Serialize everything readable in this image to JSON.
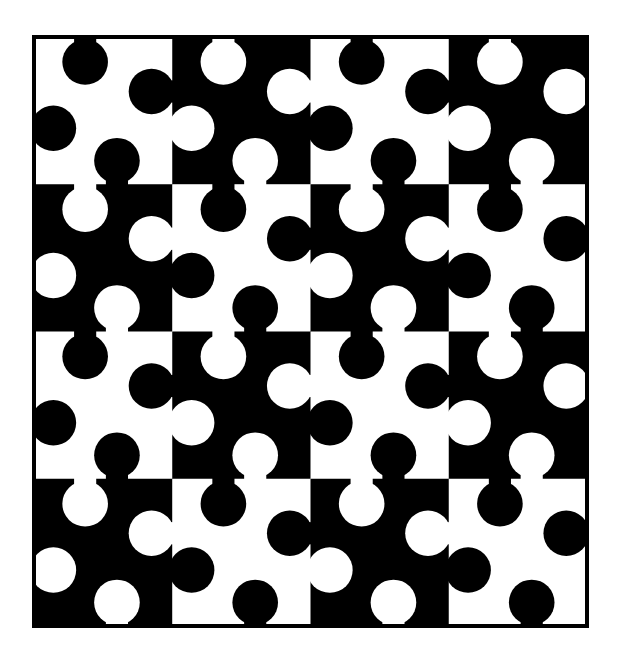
{
  "figure": {
    "title": "",
    "background": "#ffffff",
    "ink": "#000000",
    "frame": {
      "x": 34,
      "y": 37,
      "width": 553,
      "height": 589,
      "stroke_width": 4
    },
    "grid": {
      "rows": 4,
      "cols": 4
    },
    "tile_base_pattern": "checkerboard, top-left white",
    "knob_radius_ratio": 0.165,
    "neck_width_ratio": 0.16,
    "knobs": [
      {
        "name": "top",
        "cx": 0.37,
        "cy": 0.17,
        "edge": "top"
      },
      {
        "name": "right",
        "cx": 0.85,
        "cy": 0.37,
        "edge": "right"
      },
      {
        "name": "bottom",
        "cx": 0.6,
        "cy": 0.84,
        "edge": "bottom"
      },
      {
        "name": "left",
        "cx": 0.14,
        "cy": 0.62,
        "edge": "left"
      }
    ]
  }
}
